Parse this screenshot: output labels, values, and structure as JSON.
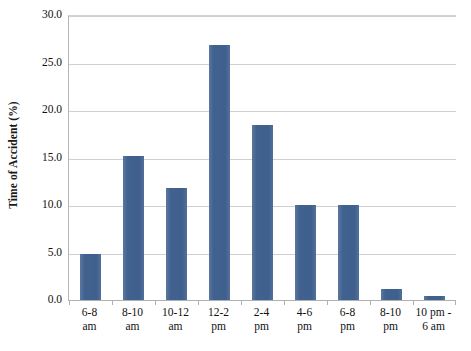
{
  "chart_data": {
    "type": "bar",
    "title": "",
    "xlabel": "",
    "ylabel": "Time of Accident (%)",
    "categories": [
      "6-8\nam",
      "8-10\nam",
      "10-12\nam",
      "12-2\npm",
      "2-4\npm",
      "4-6\npm",
      "6-8\npm",
      "8-10\npm",
      "10 pm -\n6 am"
    ],
    "values": [
      5.0,
      15.3,
      11.9,
      27.0,
      18.5,
      10.1,
      10.1,
      1.3,
      0.5
    ],
    "ylim": [
      0.0,
      30.0
    ],
    "y_ticks": [
      0.0,
      5.0,
      10.0,
      15.0,
      20.0,
      25.0,
      30.0
    ],
    "y_tick_labels": [
      "0.0",
      "5.0",
      "10.0",
      "15.0",
      "20.0",
      "25.0",
      "30.0"
    ],
    "grid": true,
    "legend": false,
    "legend_position": "none",
    "series_color": "#41618f",
    "gridline_color": "#d0d0d0",
    "axis_color": "#b0b0b0"
  }
}
